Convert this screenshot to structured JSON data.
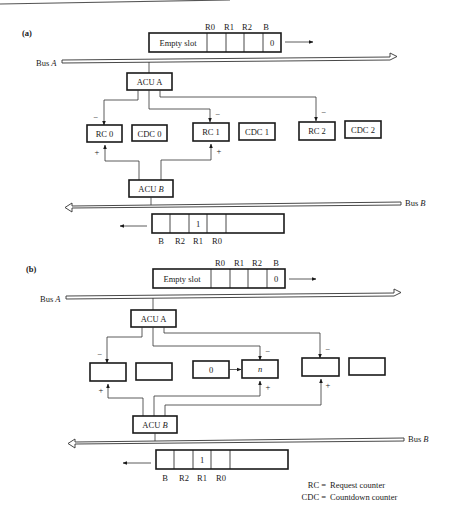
{
  "panels": [
    {
      "label": "(a)",
      "top_slot": {
        "header_labels": [
          "R0",
          "R1",
          "R2",
          "B"
        ],
        "cells": [
          "Empty slot",
          "",
          "",
          "",
          "0"
        ]
      },
      "bus_a_label": "Bus A",
      "acu_a": "ACU A",
      "units": [
        {
          "rc": "RC 0",
          "cdc": "CDC 0",
          "prefix": ""
        },
        {
          "rc": "RC 1",
          "cdc": "CDC 1",
          "prefix": ""
        },
        {
          "rc": "RC 2",
          "cdc": "CDC 2",
          "prefix": ""
        }
      ],
      "minus_sign": "−",
      "plus_sign": "+",
      "acu_b": "ACU B",
      "bus_b_label": "Bus B",
      "bottom_slot": {
        "cells": [
          "",
          "",
          "1",
          "",
          ""
        ],
        "footer_labels": [
          "B",
          "R2",
          "R1",
          "R0"
        ]
      }
    },
    {
      "label": "(b)",
      "top_slot": {
        "header_labels": [
          "R0",
          "R1",
          "R2",
          "B"
        ],
        "cells": [
          "Empty slot",
          "",
          "",
          "",
          "0"
        ]
      },
      "bus_a_label": "Bus A",
      "acu_a": "ACU A",
      "units": [
        {
          "rc": "",
          "cdc": "",
          "prefix": ""
        },
        {
          "rc": "n",
          "cdc": "",
          "prefix": "0"
        },
        {
          "rc": "",
          "cdc": "",
          "prefix": ""
        }
      ],
      "minus_sign": "−",
      "plus_sign": "+",
      "acu_b": "ACU B",
      "bus_b_label": "Bus B",
      "bottom_slot": {
        "cells": [
          "",
          "",
          "1",
          "",
          ""
        ],
        "footer_labels": [
          "B",
          "R2",
          "R1",
          "R0"
        ]
      }
    }
  ],
  "legend": [
    {
      "abbr": "RC =",
      "meaning": "Request counter"
    },
    {
      "abbr": "CDC =",
      "meaning": "Countdown counter"
    }
  ]
}
